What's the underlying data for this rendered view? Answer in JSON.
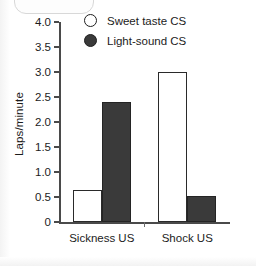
{
  "chart_data": {
    "type": "bar",
    "title": "",
    "xlabel": "",
    "ylabel": "Laps/minute",
    "categories": [
      "Sickness US",
      "Shock US"
    ],
    "series": [
      {
        "name": "Sweet taste CS",
        "marker": "open-circle",
        "color": "#ffffff",
        "values": [
          0.65,
          3.0
        ]
      },
      {
        "name": "Light-sound CS",
        "marker": "filled-circle",
        "color": "#3a3a3a",
        "values": [
          2.4,
          0.52
        ]
      }
    ],
    "ylim": [
      0,
      4.0
    ],
    "ytick_values": [
      0,
      0.5,
      1.0,
      1.5,
      2.0,
      2.5,
      3.0,
      3.5,
      4.0
    ],
    "ytick_labels": [
      "0",
      "0.5",
      "1.0",
      "1.5",
      "2.0",
      "2.5",
      "3.0",
      "3.5",
      "4.0"
    ],
    "grid": false,
    "legend_position": "top-center"
  },
  "axes": {
    "y_title": "Laps/minute"
  },
  "legend": {
    "entries": [
      {
        "label": "Sweet taste CS",
        "marker": "open-circle"
      },
      {
        "label": "Light-sound CS",
        "marker": "filled-circle"
      }
    ]
  }
}
